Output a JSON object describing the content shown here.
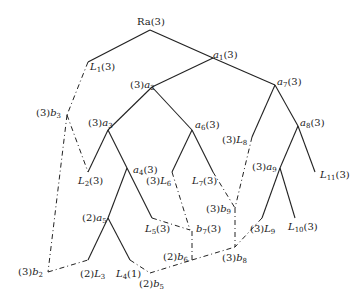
{
  "diagram": {
    "type": "tree",
    "root": "Ra(3)",
    "nodes": [
      {
        "id": "Ra",
        "label": "Ra(3)",
        "x": 150,
        "y": 30
      },
      {
        "id": "L1",
        "label": "L1(3)",
        "x": 88,
        "y": 62
      },
      {
        "id": "a1",
        "label": "a1(3)",
        "x": 213,
        "y": 58
      },
      {
        "id": "a2",
        "label": "(3)a2",
        "x": 152,
        "y": 87
      },
      {
        "id": "a7",
        "label": "a7(3)",
        "x": 275,
        "y": 85
      },
      {
        "id": "b3",
        "label": "(3)b3",
        "x": 67,
        "y": 115
      },
      {
        "id": "a3",
        "label": "(3)a3",
        "x": 108,
        "y": 130
      },
      {
        "id": "a6",
        "label": "a6(3)",
        "x": 192,
        "y": 130
      },
      {
        "id": "a8",
        "label": "a8(3)",
        "x": 298,
        "y": 126
      },
      {
        "id": "L8",
        "label": "(3)L8",
        "x": 250,
        "y": 137
      },
      {
        "id": "L2",
        "label": "L2(3)",
        "x": 88,
        "y": 172
      },
      {
        "id": "a4",
        "label": "a4(3)",
        "x": 127,
        "y": 168
      },
      {
        "id": "L6",
        "label": "(3)L6",
        "x": 171,
        "y": 172
      },
      {
        "id": "L7",
        "label": "L7(3)",
        "x": 213,
        "y": 172
      },
      {
        "id": "a9",
        "label": "(3)a9",
        "x": 280,
        "y": 168
      },
      {
        "id": "L11",
        "label": "L11(3)",
        "x": 315,
        "y": 172
      },
      {
        "id": "a5",
        "label": "(2)a5",
        "x": 108,
        "y": 218
      },
      {
        "id": "b9",
        "label": "(3)b9",
        "x": 235,
        "y": 208
      },
      {
        "id": "L5",
        "label": "L5(3)",
        "x": 152,
        "y": 220
      },
      {
        "id": "b7",
        "label": "b7(3)",
        "x": 190,
        "y": 230
      },
      {
        "id": "L9",
        "label": "(3)L9",
        "x": 258,
        "y": 228
      },
      {
        "id": "L10",
        "label": "L10(3)",
        "x": 295,
        "y": 218
      },
      {
        "id": "b6",
        "label": "(2)b6",
        "x": 192,
        "y": 260
      },
      {
        "id": "b8",
        "label": "(3)b8",
        "x": 235,
        "y": 247
      },
      {
        "id": "b2",
        "label": "(3)b2",
        "x": 48,
        "y": 272
      },
      {
        "id": "L3",
        "label": "(2)L3",
        "x": 88,
        "y": 262
      },
      {
        "id": "L4",
        "label": "L4(1)",
        "x": 130,
        "y": 262
      },
      {
        "id": "b5",
        "label": "(2)b5",
        "x": 150,
        "y": 275
      }
    ],
    "solid_edges": [
      [
        "Ra",
        "L1"
      ],
      [
        "Ra",
        "a1"
      ],
      [
        "a1",
        "a2"
      ],
      [
        "a1",
        "a7"
      ],
      [
        "a2",
        "a3"
      ],
      [
        "a2",
        "a6"
      ],
      [
        "a3",
        "L2"
      ],
      [
        "a3",
        "a4"
      ],
      [
        "a4",
        "a5"
      ],
      [
        "a4",
        "L5"
      ],
      [
        "a5",
        "L3"
      ],
      [
        "a5",
        "L4"
      ],
      [
        "a6",
        "L6"
      ],
      [
        "a6",
        "L7"
      ],
      [
        "a7",
        "L8"
      ],
      [
        "a7",
        "a8"
      ],
      [
        "a8",
        "a9"
      ],
      [
        "a8",
        "L11"
      ],
      [
        "a9",
        "L9"
      ],
      [
        "a9",
        "L10"
      ]
    ],
    "dashed_edges": [
      [
        "L1",
        "b3"
      ],
      [
        "b3",
        "L2"
      ],
      [
        "b3",
        "b2"
      ],
      [
        "b2",
        "L3"
      ],
      [
        "L4",
        "b5"
      ],
      [
        "b5",
        "b6"
      ],
      [
        "b6",
        "b8"
      ],
      [
        "b6",
        "b7"
      ],
      [
        "L5",
        "b7"
      ],
      [
        "L6",
        "b7"
      ],
      [
        "L7",
        "b9"
      ],
      [
        "L8",
        "b9"
      ],
      [
        "b9",
        "b8"
      ],
      [
        "L9",
        "b8"
      ]
    ]
  },
  "labels": {
    "Ra": "Ra(3)",
    "L1": "(3)",
    "a1": "(3)",
    "a2": "(3)",
    "a7": "(3)",
    "b3": "(3)",
    "a3": "(3)",
    "a6": "(3)",
    "a8": "(3)",
    "L8": "(3)",
    "L2": "(3)",
    "a4": "(3)",
    "L6": "(3)",
    "L7": "(3)",
    "a9": "(3)",
    "L11": "(3)",
    "a5": "(2)",
    "b9": "(3)",
    "L5": "(3)",
    "b7": "(3)",
    "L9": "(3)",
    "L10": "(3)",
    "b6": "(2)",
    "b8": "(3)",
    "b2": "(3)",
    "L3": "(2)",
    "L4": "(1)",
    "b5": "(2)"
  }
}
